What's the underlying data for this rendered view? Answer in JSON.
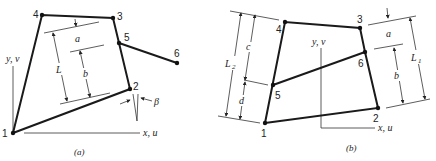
{
  "figure": {
    "panel_a": {
      "caption": "(a)",
      "axes": {
        "y_label": "y, v",
        "x_label": "x, u"
      },
      "nodes": [
        {
          "id": "1",
          "label": "1"
        },
        {
          "id": "2",
          "label": "2"
        },
        {
          "id": "3",
          "label": "3"
        },
        {
          "id": "4",
          "label": "4"
        },
        {
          "id": "5",
          "label": "5"
        },
        {
          "id": "6",
          "label": "6"
        }
      ],
      "dimensions": {
        "a": "a",
        "b": "b",
        "L": "L",
        "beta": "β"
      }
    },
    "panel_b": {
      "caption": "(b)",
      "axes": {
        "y_label": "y, v",
        "x_label": "x, u"
      },
      "nodes": [
        {
          "id": "1",
          "label": "1"
        },
        {
          "id": "2",
          "label": "2"
        },
        {
          "id": "3",
          "label": "3"
        },
        {
          "id": "4",
          "label": "4"
        },
        {
          "id": "5",
          "label": "5"
        },
        {
          "id": "6",
          "label": "6"
        }
      ],
      "dimensions": {
        "a": "a",
        "b": "b",
        "c": "c",
        "d": "d",
        "L1": "L",
        "L1_sub": "1",
        "L2": "L",
        "L2_sub": "2"
      }
    }
  }
}
